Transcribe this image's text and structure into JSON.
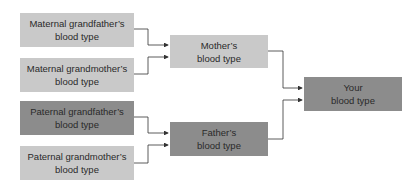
{
  "diagram": {
    "colors": {
      "light_box": "#c9c9c9",
      "dark_box": "#8c8c8c",
      "line": "#333333"
    },
    "grandparents": [
      {
        "line1": "Maternal grandfather’s",
        "line2": "blood type",
        "shade": "light"
      },
      {
        "line1": "Maternal grandmother’s",
        "line2": "blood type",
        "shade": "light"
      },
      {
        "line1": "Paternal grandfather’s",
        "line2": "blood type",
        "shade": "dark"
      },
      {
        "line1": "Paternal grandmother’s",
        "line2": "blood type",
        "shade": "light"
      }
    ],
    "parents": [
      {
        "line1": "Mother’s",
        "line2": "blood type",
        "shade": "light"
      },
      {
        "line1": "Father’s",
        "line2": "blood type",
        "shade": "dark"
      }
    ],
    "child": {
      "line1": "Your",
      "line2": "blood type",
      "shade": "dark"
    }
  }
}
